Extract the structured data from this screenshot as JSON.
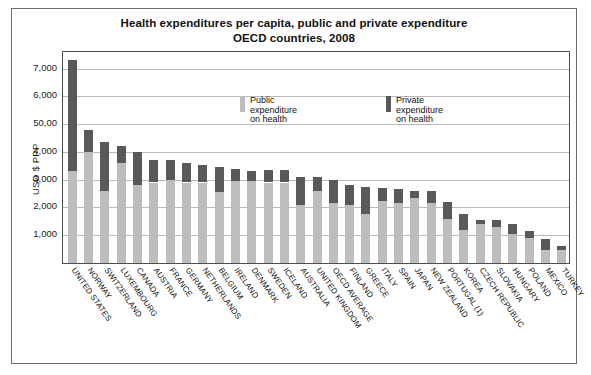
{
  "chart_data": {
    "type": "bar",
    "title": "Health expenditures per capita, public and private expenditure\nOECD countries, 2008",
    "title_line1": "Health expenditures per capita, public and private expenditure",
    "title_line2": "OECD countries, 2008",
    "xlabel": "",
    "ylabel": "USD $ PPP",
    "ylim": [
      0,
      7600
    ],
    "grid": true,
    "stacked": true,
    "legend_position": "inside-top-center",
    "tick_labels": [
      "1,000",
      "2,000",
      "3,000",
      "4,000",
      "50,00",
      "6,000",
      "7,000"
    ],
    "tick_values": [
      1000,
      2000,
      3000,
      4000,
      5000,
      6000,
      7000
    ],
    "categories": [
      "UNITED STATES",
      "NORWAY",
      "SWITZERLAND",
      "LUXEMBOURG",
      "CANADA",
      "AUSTRIA",
      "FRANCE",
      "GERMANY",
      "NETHERLANDS",
      "BELGIUM",
      "IRELAND",
      "DENMARK",
      "SWEDEN",
      "ICELAND",
      "AUSTRALIA",
      "UNITED KINGDOM",
      "OECD AVERAGE",
      "FINLAND",
      "GREECE",
      "ITALY",
      "SPAIN",
      "JAPAN",
      "NEW ZEALAND",
      "PORTUGAL (1)",
      "KOREA",
      "CZECH REPUBLIC",
      "SLOVAKIA",
      "HUNGARY",
      "POLAND",
      "MEXICO",
      "TURKEY"
    ],
    "series": [
      {
        "name": "Public expenditure on health",
        "color": "#bdbdbd",
        "values": [
          3300,
          4000,
          2600,
          3600,
          2800,
          2900,
          3000,
          2900,
          2900,
          2550,
          2950,
          2950,
          2900,
          2900,
          2100,
          2600,
          2150,
          2100,
          1750,
          2250,
          2150,
          2350,
          2150,
          1600,
          1200,
          1400,
          1300,
          1050,
          900,
          470,
          480
        ]
      },
      {
        "name": "Private expenditure on health",
        "color": "#595959",
        "values": [
          4000,
          800,
          1750,
          600,
          1200,
          800,
          700,
          700,
          620,
          900,
          450,
          350,
          450,
          450,
          1000,
          500,
          850,
          700,
          1000,
          450,
          500,
          250,
          450,
          600,
          550,
          150,
          250,
          350,
          250,
          400,
          150
        ]
      }
    ],
    "totals": [
      7300,
      4800,
      4350,
      4200,
      4000,
      3700,
      3700,
      3600,
      3520,
      3450,
      3400,
      3300,
      3350,
      3350,
      3100,
      3100,
      3000,
      2800,
      2750,
      2700,
      2650,
      2600,
      2600,
      2200,
      1750,
      1550,
      1550,
      1400,
      1150,
      870,
      630
    ]
  },
  "legend": {
    "public": {
      "label": "Public expenditure\non health",
      "swatch_name": "public-expenditure-swatch"
    },
    "private": {
      "label": "Private expenditure\non health",
      "swatch_name": "private-expenditure-swatch"
    }
  },
  "colors": {
    "public": "#bdbdbd",
    "private": "#595959",
    "gridline": "#b9b9b9",
    "axis": "#4d4d4d",
    "frame": "#6f6f6f",
    "text": "#111111"
  }
}
